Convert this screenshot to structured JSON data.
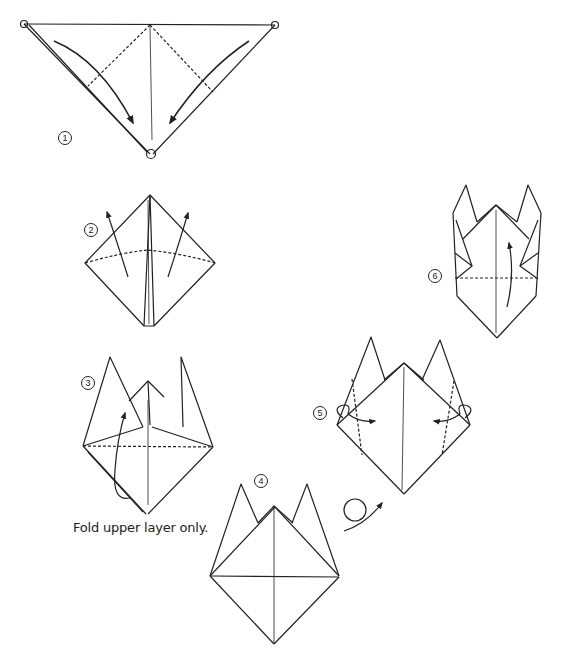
{
  "diagram": {
    "type": "origami-instructions",
    "steps": [
      {
        "number": "1",
        "label": "①"
      },
      {
        "number": "2",
        "label": "②"
      },
      {
        "number": "3",
        "label": "③"
      },
      {
        "number": "4",
        "label": "④"
      },
      {
        "number": "5",
        "label": "⑤"
      },
      {
        "number": "6",
        "label": "⑥"
      }
    ],
    "caption": "Fold upper layer only.",
    "colors": {
      "line": "#222222",
      "background": "#ffffff"
    }
  }
}
